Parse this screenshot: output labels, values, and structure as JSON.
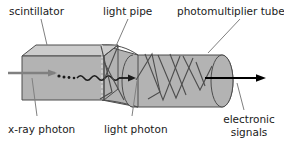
{
  "figure": {
    "background_color": "#ffffff",
    "body_fill": "#b3b3b3",
    "top_face_fill": "#cccccc",
    "outline_color": "#4d4d4d",
    "ray_color": "#4d4d4d",
    "xray_arrow_color": "#808080",
    "signal_arrow_color": "#000000",
    "leader_color": "#808080",
    "text_color": "#1a1a1a"
  },
  "labels": {
    "scintillator": "scintillator",
    "light_pipe": "light pipe",
    "photomultiplier_tube": "photomultiplier tube",
    "xray_photon": "x-ray photon",
    "light_photon": "light photon",
    "electronic_signals_line1": "electronic",
    "electronic_signals_line2": "signals"
  },
  "components": [
    {
      "name": "scintillator",
      "shape": "rectangular-box",
      "label": "scintillator"
    },
    {
      "name": "light-pipe",
      "shape": "tapered-funnel",
      "label": "light pipe"
    },
    {
      "name": "photomultiplier-tube",
      "shape": "cylinder",
      "label": "photomultiplier tube"
    }
  ],
  "rays": [
    {
      "name": "xray-photon",
      "style": "straight-arrow",
      "color": "#808080",
      "label": "x-ray photon"
    },
    {
      "name": "interaction-dots",
      "style": "dotted",
      "color": "#1a1a1a"
    },
    {
      "name": "light-photon",
      "style": "wavy-arrow",
      "color": "#1a1a1a",
      "label": "light photon"
    },
    {
      "name": "internal-reflections",
      "style": "zigzag",
      "color": "#4d4d4d"
    },
    {
      "name": "electronic-signals",
      "style": "straight-arrow",
      "color": "#000000",
      "label": "electronic signals"
    }
  ]
}
